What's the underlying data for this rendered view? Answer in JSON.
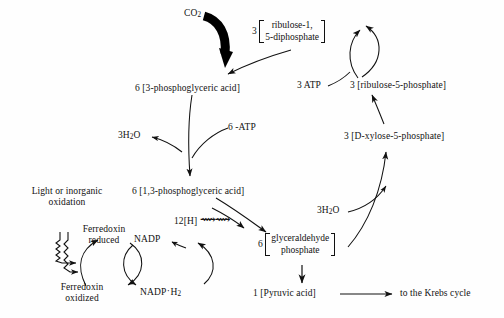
{
  "diagram": {
    "type": "biochemical-pathway",
    "stroke_color": "#111111",
    "background_color": "#fefefe"
  },
  "nodes": {
    "co2": {
      "label": "CO",
      "sub": "2"
    },
    "ribulose_diphosphate": {
      "coefficient": "3",
      "line1": "ribulose-1,",
      "line2": "5-diphosphate"
    },
    "atp_3": {
      "label": "3 ATP"
    },
    "ribulose_5_phosphate": {
      "label": "3 [ribulose-5-phosphate]"
    },
    "phosphoglyceric_acid_3": {
      "label": "6 [3-phosphoglyceric acid]"
    },
    "water_left": {
      "label": "3H",
      "sub": "2",
      "tail": "O"
    },
    "atp_6": {
      "label": "6 -ATP"
    },
    "xylose_5_phosphate": {
      "label": "3 [D-xylose-5-phosphate]"
    },
    "phosphoglyceric_acid_13": {
      "label": "6 [1,3-phosphoglyceric acid]"
    },
    "water_right": {
      "label": "3H",
      "sub": "2",
      "tail": "O"
    },
    "light_source": {
      "line1": "Light or inorganic",
      "line2": "oxidation"
    },
    "ferredoxin_reduced": {
      "line1": "Ferredoxin",
      "line2": "reduced"
    },
    "ferredoxin_oxidized": {
      "line1": "Ferredoxin",
      "line2": "oxidized"
    },
    "nadp": {
      "label": "NADP"
    },
    "nadp_h2": {
      "label": "NADP",
      "mid": "·",
      "tail": "H",
      "sub": "2"
    },
    "hydrogen_12": {
      "label": "12[H]",
      "glyph": "⟿⟿"
    },
    "glyceraldehyde_phosphate": {
      "coefficient": "6",
      "line1": "glyceraldehyde",
      "line2": "phosphate"
    },
    "pyruvic_acid": {
      "label": "1 [Pyruvic acid]"
    },
    "krebs_cycle": {
      "label": "to the Krebs cycle"
    }
  }
}
